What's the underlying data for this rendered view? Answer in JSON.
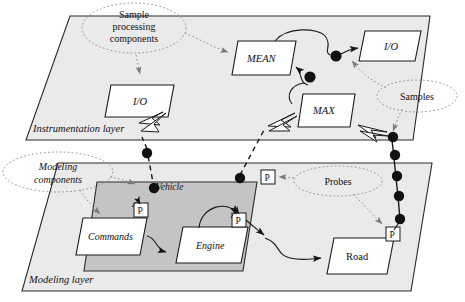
{
  "figure": {
    "background_color": "#ffffff",
    "layer_fill": "#e9e9e9",
    "vehicle_fill": "#c4c4c4",
    "node_fill": "#ffffff",
    "stroke_color": "#1a1a1a",
    "probe_color": "#111111"
  },
  "layers": [
    {
      "id": "instrumentation",
      "label": "Instrumentation layer",
      "style": "italic"
    },
    {
      "id": "modeling",
      "label": "Modeling layer",
      "style": "italic"
    }
  ],
  "groups": [
    {
      "id": "vehicle",
      "label": "Vehicle",
      "style": "italic"
    }
  ],
  "nodes": [
    {
      "id": "io-left",
      "label": "I/O",
      "layer": "instrumentation",
      "style": "italic"
    },
    {
      "id": "mean",
      "label": "MEAN",
      "layer": "instrumentation",
      "style": "italic"
    },
    {
      "id": "io-right",
      "label": "I/O",
      "layer": "instrumentation",
      "style": "italic"
    },
    {
      "id": "max",
      "label": "MAX",
      "layer": "instrumentation",
      "style": "italic"
    },
    {
      "id": "commands",
      "label": "Commands",
      "layer": "modeling",
      "group": "vehicle",
      "style": "italic"
    },
    {
      "id": "engine",
      "label": "Engine",
      "layer": "modeling",
      "group": "vehicle",
      "style": "italic"
    },
    {
      "id": "road",
      "label": "Road",
      "layer": "modeling",
      "style": "normal"
    }
  ],
  "probes": [
    {
      "id": "probe-commands",
      "label": "P"
    },
    {
      "id": "probe-vehicle-top",
      "label": "P"
    },
    {
      "id": "probe-engine",
      "label": "P"
    },
    {
      "id": "probe-road",
      "label": "P"
    }
  ],
  "callouts": [
    {
      "id": "sample-processing-components",
      "lines": [
        "Sample",
        "processing",
        "components"
      ],
      "style": "normal"
    },
    {
      "id": "samples",
      "lines": [
        "Samples"
      ],
      "style": "normal"
    },
    {
      "id": "modeling-components",
      "lines": [
        "Modeling",
        "components"
      ],
      "style": "italic"
    },
    {
      "id": "probes",
      "lines": [
        "Probes"
      ],
      "style": "normal"
    }
  ],
  "sample_chains": [
    {
      "id": "chain-left",
      "dot_count": 2,
      "from": "probe-vehicle-left",
      "to": "io-left"
    },
    {
      "id": "chain-mid",
      "dot_count": 1,
      "from": "probe-vehicle-top",
      "to": "max"
    },
    {
      "id": "chain-right",
      "dot_count": 5,
      "from": "probe-road",
      "to": "max"
    },
    {
      "id": "chain-mean",
      "dot_count": 1,
      "from": "mean",
      "to": "max"
    },
    {
      "id": "chain-io",
      "dot_count": 1,
      "from": "mean",
      "to": "io-right"
    }
  ]
}
